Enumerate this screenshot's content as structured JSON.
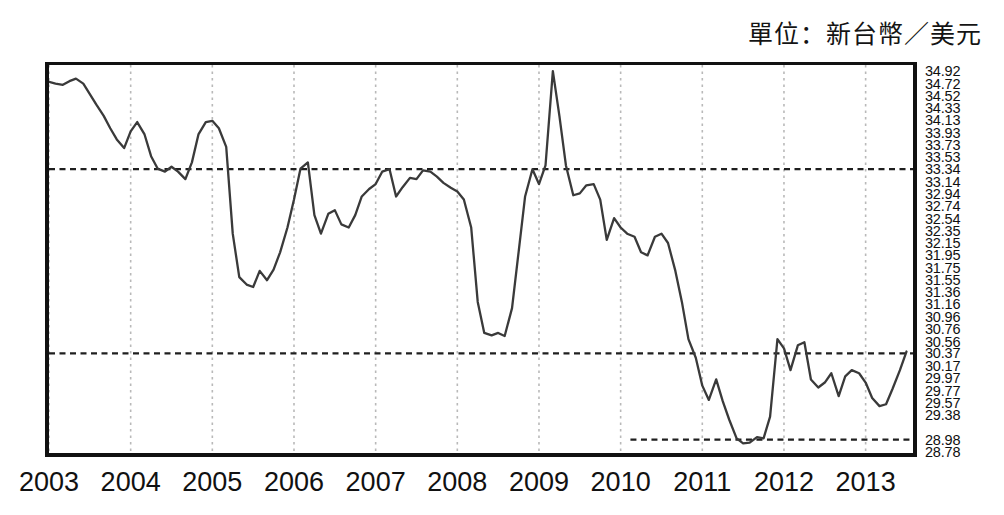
{
  "caption": {
    "unit_text": "單位：新台幣／美元"
  },
  "chart_data": {
    "type": "line",
    "title": "",
    "subtitle": "",
    "annotations": [
      "單位：新台幣／美元"
    ],
    "xlabel": "",
    "ylabel": "",
    "grid": true,
    "legend": null,
    "legend_position": "none",
    "line_color": "#3a3a3a",
    "frame_color": "#111111",
    "gridline_color": "#b9b9b9",
    "refline_color": "#1f1f1f",
    "xlim": [
      2003.0,
      2013.58
    ],
    "ylim": [
      28.78,
      35.02
    ],
    "x_tick_labels": [
      "2003",
      "2004",
      "2005",
      "2006",
      "2007",
      "2008",
      "2009",
      "2010",
      "2011",
      "2012",
      "2013"
    ],
    "x_tick_values": [
      2003,
      2004,
      2005,
      2006,
      2007,
      2008,
      2009,
      2010,
      2011,
      2012,
      2013
    ],
    "y_tick_labels": [
      "34.92",
      "34.72",
      "34.52",
      "34.33",
      "34.13",
      "33.93",
      "33.73",
      "33.53",
      "33.34",
      "33.14",
      "32.94",
      "32.74",
      "32.54",
      "32.35",
      "32.15",
      "31.95",
      "31.75",
      "31.55",
      "31.36",
      "31.16",
      "30.96",
      "30.76",
      "30.56",
      "30.37",
      "30.17",
      "29.97",
      "29.77",
      "29.57",
      "29.38",
      "28.98",
      "28.78"
    ],
    "y_tick_values": [
      34.92,
      34.72,
      34.52,
      34.33,
      34.13,
      33.93,
      33.73,
      33.53,
      33.34,
      33.14,
      32.94,
      32.74,
      32.54,
      32.35,
      32.15,
      31.95,
      31.75,
      31.55,
      31.36,
      31.16,
      30.96,
      30.76,
      30.56,
      30.37,
      30.17,
      29.97,
      29.77,
      29.57,
      29.38,
      28.98,
      28.78
    ],
    "reference_lines": [
      {
        "value": 33.34,
        "x_start": 2003.0,
        "x_end": 2013.58,
        "style": "dashed"
      },
      {
        "value": 30.37,
        "x_start": 2003.0,
        "x_end": 2013.58,
        "style": "dashed"
      },
      {
        "value": 28.98,
        "x_start": 2010.12,
        "x_end": 2013.58,
        "style": "dashed"
      }
    ],
    "series": [
      {
        "name": "NTD per USD",
        "x": [
          2003.0,
          2003.08,
          2003.17,
          2003.25,
          2003.33,
          2003.42,
          2003.5,
          2003.58,
          2003.67,
          2003.75,
          2003.83,
          2003.92,
          2004.0,
          2004.08,
          2004.17,
          2004.25,
          2004.33,
          2004.42,
          2004.5,
          2004.58,
          2004.67,
          2004.75,
          2004.83,
          2004.92,
          2005.0,
          2005.08,
          2005.17,
          2005.25,
          2005.33,
          2005.42,
          2005.5,
          2005.58,
          2005.67,
          2005.75,
          2005.83,
          2005.92,
          2006.0,
          2006.08,
          2006.17,
          2006.25,
          2006.33,
          2006.42,
          2006.5,
          2006.58,
          2006.67,
          2006.75,
          2006.83,
          2006.92,
          2007.0,
          2007.08,
          2007.17,
          2007.25,
          2007.33,
          2007.42,
          2007.5,
          2007.58,
          2007.67,
          2007.75,
          2007.83,
          2007.92,
          2008.0,
          2008.08,
          2008.17,
          2008.25,
          2008.33,
          2008.42,
          2008.5,
          2008.58,
          2008.67,
          2008.75,
          2008.83,
          2008.92,
          2009.0,
          2009.08,
          2009.17,
          2009.25,
          2009.33,
          2009.42,
          2009.5,
          2009.58,
          2009.67,
          2009.75,
          2009.83,
          2009.92,
          2010.0,
          2010.08,
          2010.17,
          2010.25,
          2010.33,
          2010.42,
          2010.5,
          2010.58,
          2010.67,
          2010.75,
          2010.83,
          2010.92,
          2011.0,
          2011.08,
          2011.17,
          2011.25,
          2011.33,
          2011.42,
          2011.5,
          2011.58,
          2011.67,
          2011.75,
          2011.83,
          2011.92,
          2012.0,
          2012.08,
          2012.17,
          2012.25,
          2012.33,
          2012.42,
          2012.5,
          2012.58,
          2012.67,
          2012.75,
          2012.83,
          2012.92,
          2013.0,
          2013.08,
          2013.17,
          2013.25,
          2013.33,
          2013.42,
          2013.5
        ],
        "values": [
          34.75,
          34.72,
          34.7,
          34.76,
          34.8,
          34.72,
          34.55,
          34.38,
          34.2,
          34.0,
          33.82,
          33.68,
          33.95,
          34.1,
          33.9,
          33.55,
          33.35,
          33.3,
          33.38,
          33.3,
          33.18,
          33.45,
          33.9,
          34.1,
          34.12,
          34.0,
          33.7,
          32.3,
          31.6,
          31.48,
          31.44,
          31.7,
          31.55,
          31.72,
          32.0,
          32.4,
          32.85,
          33.35,
          33.45,
          32.6,
          32.3,
          32.62,
          32.68,
          32.45,
          32.4,
          32.6,
          32.9,
          33.02,
          33.1,
          33.3,
          33.34,
          32.9,
          33.05,
          33.2,
          33.18,
          33.32,
          33.3,
          33.22,
          33.12,
          33.04,
          32.98,
          32.85,
          32.4,
          31.2,
          30.7,
          30.66,
          30.7,
          30.65,
          31.1,
          32.0,
          32.9,
          33.34,
          33.1,
          33.4,
          34.92,
          34.2,
          33.4,
          32.92,
          32.95,
          33.08,
          33.1,
          32.85,
          32.2,
          32.55,
          32.4,
          32.3,
          32.25,
          32.0,
          31.95,
          32.25,
          32.3,
          32.15,
          31.7,
          31.2,
          30.6,
          30.3,
          29.85,
          29.62,
          29.95,
          29.6,
          29.3,
          29.0,
          28.92,
          28.93,
          29.02,
          29.0,
          29.35,
          30.6,
          30.45,
          30.1,
          30.5,
          30.55,
          29.95,
          29.82,
          29.9,
          30.05,
          29.68,
          30.0,
          30.1,
          30.05,
          29.9,
          29.65,
          29.52,
          29.55,
          29.8,
          30.1,
          30.4
        ],
        "color": "#3a3a3a"
      }
    ]
  }
}
